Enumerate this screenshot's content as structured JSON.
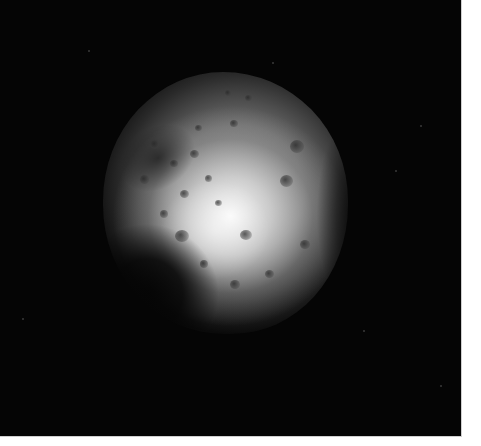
{
  "image": {
    "subject": "cratered moon",
    "background_color": "#050505",
    "border_color": "#ffffff"
  }
}
